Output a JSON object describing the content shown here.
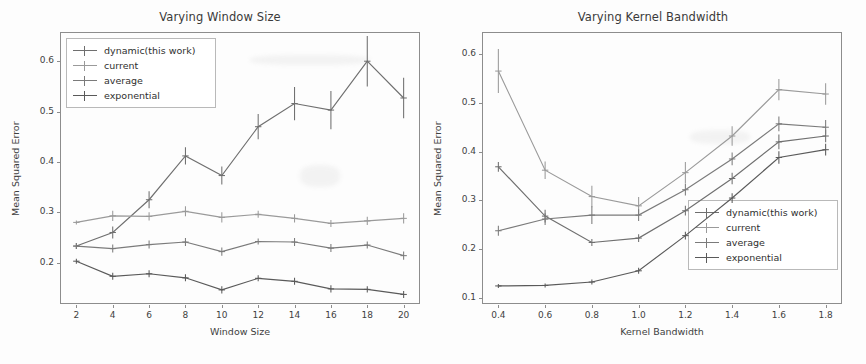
{
  "figure": {
    "background_color": "#fdfdfd",
    "axis_color": "#8d8d8d",
    "text_color": "#3f3f3f"
  },
  "legend_labels": {
    "dynamic": "dynamic(this work)",
    "current": "current",
    "average": "average",
    "exponential": "exponential"
  },
  "series_colors": {
    "dynamic": "#6f6f6f",
    "current": "#9a9a9a",
    "average": "#7b7b7b",
    "exponential": "#5a5a5a"
  },
  "chart_data": [
    {
      "type": "line",
      "id": "varying-window-size",
      "title": "Varying Window Size",
      "xlabel": "Window Size",
      "ylabel": "Mean Squared Error",
      "x": [
        2,
        4,
        6,
        8,
        10,
        12,
        14,
        16,
        18,
        20
      ],
      "xlim": [
        1.1,
        20.9
      ],
      "ylim": [
        0.118,
        0.658
      ],
      "xticks": [
        2,
        4,
        6,
        8,
        10,
        12,
        14,
        16,
        18,
        20
      ],
      "xticklabels": [
        "2",
        "4",
        "6",
        "8",
        "10",
        "12",
        "14",
        "16",
        "18",
        "20"
      ],
      "yticks": [
        0.2,
        0.3,
        0.4,
        0.5,
        0.6
      ],
      "yticklabels": [
        "0.2",
        "0.3",
        "0.4",
        "0.5",
        "0.6"
      ],
      "grid": false,
      "legend_position": "upper left",
      "series": [
        {
          "name": "dynamic(this work)",
          "values": [
            0.233,
            0.26,
            0.325,
            0.412,
            0.373,
            0.47,
            0.516,
            0.503,
            0.6,
            0.527
          ],
          "errors": [
            0.006,
            0.012,
            0.017,
            0.017,
            0.018,
            0.025,
            0.033,
            0.038,
            0.05,
            0.04
          ]
        },
        {
          "name": "current",
          "values": [
            0.28,
            0.293,
            0.292,
            0.302,
            0.29,
            0.296,
            0.288,
            0.278,
            0.283,
            0.288
          ],
          "errors": [
            0.004,
            0.01,
            0.008,
            0.01,
            0.01,
            0.007,
            0.008,
            0.007,
            0.008,
            0.01
          ]
        },
        {
          "name": "average",
          "values": [
            0.233,
            0.228,
            0.236,
            0.241,
            0.222,
            0.242,
            0.241,
            0.229,
            0.235,
            0.214
          ],
          "errors": [
            0.006,
            0.008,
            0.008,
            0.008,
            0.008,
            0.006,
            0.008,
            0.008,
            0.007,
            0.008
          ]
        },
        {
          "name": "exponential",
          "values": [
            0.203,
            0.173,
            0.178,
            0.17,
            0.146,
            0.169,
            0.163,
            0.148,
            0.147,
            0.137
          ],
          "errors": [
            0.005,
            0.007,
            0.007,
            0.007,
            0.007,
            0.006,
            0.007,
            0.007,
            0.006,
            0.007
          ]
        }
      ]
    },
    {
      "type": "line",
      "id": "varying-kernel-bandwidth",
      "title": "Varying Kernel Bandwidth",
      "xlabel": "Kernel Bandwidth",
      "ylabel": "Mean Squared Error",
      "x": [
        0.4,
        0.6,
        0.8,
        1.0,
        1.2,
        1.4,
        1.6,
        1.8
      ],
      "xlim": [
        0.33,
        1.87
      ],
      "ylim": [
        0.088,
        0.645
      ],
      "xticks": [
        0.4,
        0.6,
        0.8,
        1.0,
        1.2,
        1.4,
        1.6,
        1.8
      ],
      "xticklabels": [
        "0.4",
        "0.6",
        "0.8",
        "1.0",
        "1.2",
        "1.4",
        "1.6",
        "1.8"
      ],
      "yticks": [
        0.1,
        0.2,
        0.3,
        0.4,
        0.5,
        0.6
      ],
      "yticklabels": [
        "0.1",
        "0.2",
        "0.3",
        "0.4",
        "0.5",
        "0.6"
      ],
      "grid": false,
      "legend_position": "lower right",
      "series": [
        {
          "name": "dynamic(this work)",
          "values": [
            0.369,
            0.268,
            0.214,
            0.223,
            0.279,
            0.345,
            0.42,
            0.432
          ],
          "errors": [
            0.01,
            0.013,
            0.007,
            0.008,
            0.01,
            0.012,
            0.015,
            0.013
          ]
        },
        {
          "name": "current",
          "values": [
            0.565,
            0.362,
            0.308,
            0.289,
            0.357,
            0.432,
            0.527,
            0.518
          ],
          "errors": [
            0.045,
            0.018,
            0.022,
            0.018,
            0.022,
            0.02,
            0.022,
            0.022
          ]
        },
        {
          "name": "average",
          "values": [
            0.238,
            0.262,
            0.27,
            0.27,
            0.322,
            0.385,
            0.457,
            0.45
          ],
          "errors": [
            0.01,
            0.012,
            0.018,
            0.012,
            0.012,
            0.013,
            0.015,
            0.015
          ]
        },
        {
          "name": "exponential",
          "values": [
            0.125,
            0.126,
            0.133,
            0.156,
            0.228,
            0.305,
            0.388,
            0.404
          ],
          "errors": [
            0.004,
            0.004,
            0.005,
            0.006,
            0.008,
            0.01,
            0.013,
            0.012
          ]
        }
      ]
    }
  ]
}
